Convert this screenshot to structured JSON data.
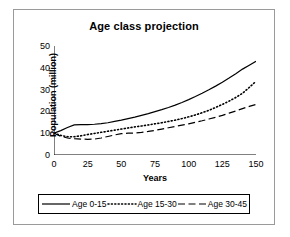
{
  "chart_data": {
    "type": "line",
    "title": "Age class projection",
    "xlabel": "Years",
    "ylabel": "Population (million)",
    "xlim": [
      0,
      150
    ],
    "ylim": [
      0,
      50
    ],
    "xticks": [
      0,
      25,
      50,
      75,
      100,
      125,
      150
    ],
    "yticks": [
      0,
      10,
      20,
      30,
      40,
      50
    ],
    "grid": false,
    "legend_position": "bottom",
    "x": [
      0,
      5,
      10,
      15,
      20,
      25,
      30,
      35,
      40,
      45,
      50,
      55,
      60,
      65,
      70,
      75,
      80,
      85,
      90,
      95,
      100,
      105,
      110,
      115,
      120,
      125,
      130,
      135,
      140,
      145,
      150
    ],
    "series": [
      {
        "name": "Age 0-15",
        "style": "solid",
        "color": "#000000",
        "values": [
          10.0,
          11.2,
          12.6,
          13.8,
          13.9,
          13.9,
          14.1,
          14.4,
          14.8,
          15.4,
          16.0,
          16.7,
          17.4,
          18.2,
          19.0,
          19.9,
          20.8,
          21.8,
          22.9,
          24.1,
          25.4,
          26.8,
          28.3,
          29.9,
          31.6,
          33.4,
          35.3,
          37.3,
          39.4,
          41.2,
          43.0
        ]
      },
      {
        "name": "Age 15-30",
        "style": "dotted",
        "color": "#000000",
        "values": [
          10.0,
          9.0,
          8.4,
          8.4,
          8.8,
          9.4,
          9.9,
          10.4,
          10.9,
          11.4,
          11.9,
          12.4,
          12.9,
          13.3,
          13.8,
          14.3,
          14.8,
          15.4,
          16.0,
          16.7,
          17.5,
          18.4,
          19.4,
          20.5,
          21.8,
          23.2,
          24.7,
          26.4,
          28.3,
          31.0,
          33.8
        ]
      },
      {
        "name": "Age 30-45",
        "style": "dashed",
        "color": "#000000",
        "values": [
          10.0,
          8.6,
          7.8,
          7.5,
          7.3,
          7.2,
          7.3,
          7.8,
          8.5,
          9.2,
          9.8,
          10.0,
          10.1,
          10.4,
          10.8,
          11.3,
          11.9,
          12.5,
          13.1,
          13.7,
          14.3,
          15.0,
          15.7,
          16.5,
          17.3,
          18.2,
          19.2,
          20.2,
          21.3,
          22.3,
          23.2
        ]
      }
    ]
  }
}
